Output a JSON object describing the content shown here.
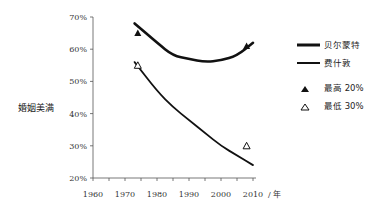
{
  "chart_data": {
    "type": "line",
    "title": "",
    "xlabel": "/ 年",
    "ylabel": "婚姻美满",
    "x_ticks": [
      "1960",
      "1970",
      "1980",
      "1990",
      "2000",
      "2010"
    ],
    "y_ticks": [
      "20%",
      "30%",
      "40%",
      "50%",
      "60%",
      "70%"
    ],
    "xlim": [
      1960,
      2012
    ],
    "ylim": [
      20,
      70
    ],
    "grid": false,
    "legend_position": "right",
    "series": [
      {
        "name": "贝尔蒙特",
        "style": "thick-line",
        "x": [
          1973,
          1980,
          1985,
          1990,
          1995,
          2000,
          2005,
          2010
        ],
        "values": [
          68,
          62,
          58,
          57,
          56,
          56.5,
          58,
          62
        ]
      },
      {
        "name": "费什敦",
        "style": "line",
        "x": [
          1973,
          1980,
          1985,
          1990,
          1995,
          2000,
          2005,
          2010
        ],
        "values": [
          56,
          47,
          42,
          38,
          34,
          30,
          27,
          24
        ]
      }
    ],
    "markers": [
      {
        "name": "最高 20%",
        "symbol": "filled-triangle",
        "points": [
          {
            "x": 1974,
            "y": 65
          },
          {
            "x": 2008,
            "y": 61
          }
        ]
      },
      {
        "name": "最低 30%",
        "symbol": "open-triangle",
        "points": [
          {
            "x": 1974,
            "y": 55
          },
          {
            "x": 2008,
            "y": 30
          }
        ]
      }
    ]
  },
  "legend": {
    "items": [
      {
        "label": "贝尔蒙特"
      },
      {
        "label": "费什敦"
      },
      {
        "label": "最高 20%"
      },
      {
        "label": "最低 30%"
      }
    ]
  },
  "axis": {
    "ylabel": "婚姻美满",
    "xunit": "/ 年"
  }
}
